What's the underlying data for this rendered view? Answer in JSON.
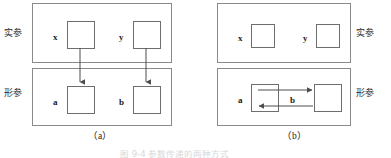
{
  "figure": {
    "subfigures": [
      {
        "id": "a",
        "caption": "（a）",
        "labels": {
          "top": "实参",
          "bottom": "形参"
        },
        "top_cells": [
          {
            "name": "x"
          },
          {
            "name": "y"
          }
        ],
        "bottom_cells": [
          {
            "name": "a"
          },
          {
            "name": "b"
          }
        ],
        "arrows": "two vertical arrows pointing down from x to a and from y to b"
      },
      {
        "id": "b",
        "caption": "（b）",
        "labels": {
          "top": "实参",
          "bottom": "形参"
        },
        "top_cells": [
          {
            "name": "x"
          },
          {
            "name": "y"
          }
        ],
        "bottom_cells": [
          {
            "name": "a"
          },
          {
            "name": ""
          }
        ],
        "middle_label": "b",
        "arrows": "two horizontal arrows between a and the right cell, one pointing right and one pointing left"
      }
    ],
    "bottom_caption_partial": "图 9-4 参数传递的两种方式"
  },
  "colors": {
    "background": "#ffffff",
    "panel_border": "#8a8a8a",
    "cell_border": "#6e6e6e",
    "arrow": "#4d4d4d",
    "text": "#1a1a1a"
  }
}
